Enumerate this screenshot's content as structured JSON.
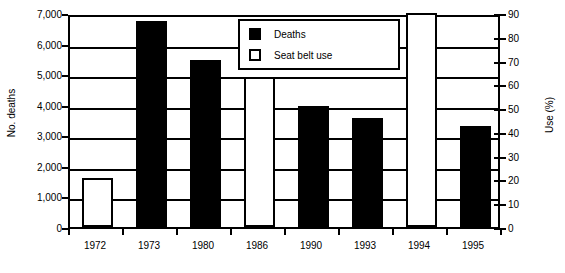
{
  "chart_data": {
    "type": "bar",
    "title": "",
    "subtitle": "",
    "categories": [
      "1972",
      "1973",
      "1980",
      "1986",
      "1990",
      "1993",
      "1994",
      "1995"
    ],
    "series": [
      {
        "name": "Deaths",
        "axis": "left",
        "unit": "deaths",
        "color": "#000000",
        "style": "filled",
        "values": [
          null,
          6750,
          5450,
          null,
          3950,
          3560,
          null,
          3300
        ]
      },
      {
        "name": "Seat belt use",
        "axis": "right",
        "unit": "%",
        "color": "#ffffff",
        "style": "hollow",
        "values": [
          20.5,
          null,
          null,
          63,
          null,
          null,
          90,
          null
        ]
      }
    ],
    "bars": [
      {
        "category": "1972",
        "series": "Seat belt use",
        "value": 20.5,
        "axis": "right",
        "style": "hollow"
      },
      {
        "category": "1973",
        "series": "Deaths",
        "value": 6750,
        "axis": "left",
        "style": "filled"
      },
      {
        "category": "1980",
        "series": "Deaths",
        "value": 5450,
        "axis": "left",
        "style": "filled"
      },
      {
        "category": "1986",
        "series": "Seat belt use",
        "value": 63,
        "axis": "right",
        "style": "hollow"
      },
      {
        "category": "1990",
        "series": "Deaths",
        "value": 3950,
        "axis": "left",
        "style": "filled"
      },
      {
        "category": "1993",
        "series": "Deaths",
        "value": 3560,
        "axis": "left",
        "style": "filled"
      },
      {
        "category": "1994",
        "series": "Seat belt use",
        "value": 90,
        "axis": "right",
        "style": "hollow"
      },
      {
        "category": "1995",
        "series": "Deaths",
        "value": 3300,
        "axis": "left",
        "style": "filled"
      }
    ],
    "xlabel": "",
    "ylabel": "No. deaths",
    "y2label": "Use (%)",
    "ylim": [
      0,
      7000
    ],
    "y2lim": [
      0,
      90
    ],
    "yticks": [
      0,
      1000,
      2000,
      3000,
      4000,
      5000,
      6000,
      7000
    ],
    "ytick_labels": [
      "0",
      "1,000",
      "2,000",
      "3,000",
      "4,000",
      "5,000",
      "6,000",
      "7,000"
    ],
    "y2ticks": [
      0,
      10,
      20,
      30,
      40,
      50,
      60,
      70,
      80,
      90
    ],
    "y2tick_labels": [
      "0",
      "10",
      "20",
      "30",
      "40",
      "50",
      "60",
      "70",
      "80",
      "90"
    ],
    "grid": true,
    "grid_axis": "y",
    "legend": [
      "Deaths",
      "Seat belt use"
    ],
    "legend_position": "top-center"
  },
  "legend": {
    "items": [
      {
        "label": "Deaths",
        "swatch": "filled-square-icon"
      },
      {
        "label": "Seat belt use",
        "swatch": "hollow-square-icon"
      }
    ]
  },
  "axes": {
    "left_title": "No. deaths",
    "right_title": "Use (%)"
  },
  "caption": {
    "text": ""
  }
}
